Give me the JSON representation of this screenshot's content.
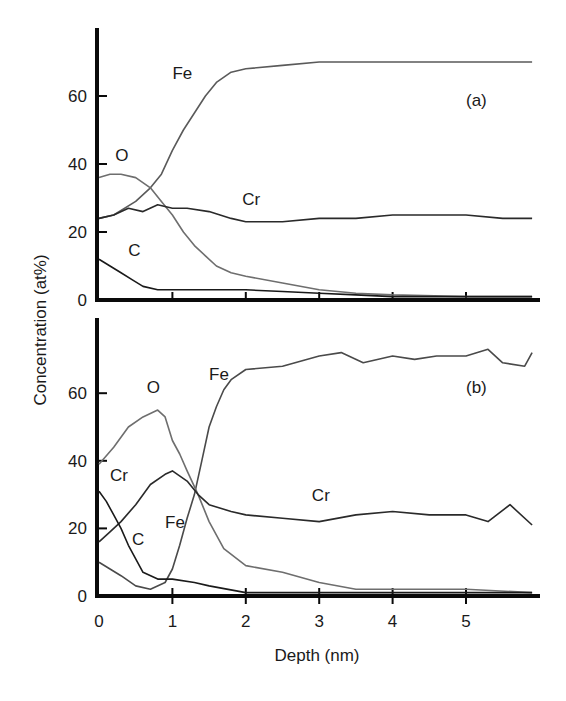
{
  "chart_data": [
    {
      "panel": "(a)",
      "type": "line",
      "title": "",
      "xlabel": "Depth (nm)",
      "ylabel": "Concentration (at%)",
      "xlim": [
        0,
        5.9
      ],
      "ylim": [
        0,
        75
      ],
      "x_ticks": [
        0,
        1,
        2,
        3,
        4,
        5
      ],
      "y_ticks": [
        0,
        20,
        40,
        60
      ],
      "grid": false,
      "legend": "inline labels",
      "series": [
        {
          "name": "Fe",
          "color": "#5a5a5a",
          "x": [
            0,
            0.2,
            0.5,
            0.7,
            0.85,
            1.0,
            1.15,
            1.3,
            1.45,
            1.6,
            1.8,
            2.0,
            2.5,
            3.0,
            3.5,
            4.0,
            4.5,
            5.0,
            5.5,
            5.9
          ],
          "y": [
            24,
            25,
            29,
            33,
            37,
            44,
            50,
            55,
            60,
            64,
            67,
            68,
            69,
            70,
            70,
            70,
            70,
            70,
            70,
            70
          ]
        },
        {
          "name": "O",
          "color": "#6e6e6e",
          "x": [
            0,
            0.15,
            0.3,
            0.5,
            0.7,
            0.85,
            1.0,
            1.15,
            1.3,
            1.45,
            1.6,
            1.8,
            2.0,
            2.5,
            3.0,
            3.5,
            4.0,
            5.0,
            5.9
          ],
          "y": [
            36,
            37,
            37,
            36,
            33,
            29,
            25,
            20,
            16,
            13,
            10,
            8,
            7,
            5,
            3,
            2,
            1.5,
            1,
            1
          ]
        },
        {
          "name": "Cr",
          "color": "#2a2a2a",
          "x": [
            0,
            0.2,
            0.4,
            0.6,
            0.8,
            1.0,
            1.2,
            1.5,
            1.8,
            2.0,
            2.5,
            3.0,
            3.5,
            4.0,
            4.5,
            5.0,
            5.5,
            5.9
          ],
          "y": [
            24,
            25,
            27,
            26,
            28,
            27,
            27,
            26,
            24,
            23,
            23,
            24,
            24,
            25,
            25,
            25,
            24,
            24
          ]
        },
        {
          "name": "C",
          "color": "#1a1a1a",
          "x": [
            0,
            0.15,
            0.3,
            0.45,
            0.6,
            0.8,
            1.0,
            1.5,
            2.0,
            2.5,
            3.0,
            3.5,
            4.0,
            5.0,
            5.9
          ],
          "y": [
            12,
            10,
            8,
            6,
            4,
            3,
            3,
            3,
            3,
            2.5,
            2,
            1.5,
            1,
            1,
            1
          ]
        }
      ],
      "annotations": [
        {
          "text": "Fe",
          "x": 1.0,
          "y": 65
        },
        {
          "text": "O",
          "x": 0.22,
          "y": 41
        },
        {
          "text": "Cr",
          "x": 1.95,
          "y": 28
        },
        {
          "text": "C",
          "x": 0.4,
          "y": 13
        },
        {
          "text": "(a)",
          "x": 5.0,
          "y": 57
        }
      ]
    },
    {
      "panel": "(b)",
      "type": "line",
      "title": "",
      "xlabel": "Depth (nm)",
      "ylabel": "Concentration (at%)",
      "xlim": [
        0,
        5.9
      ],
      "ylim": [
        0,
        75
      ],
      "x_ticks": [
        0,
        1,
        2,
        3,
        4,
        5
      ],
      "y_ticks": [
        0,
        20,
        40,
        60
      ],
      "grid": false,
      "legend": "inline labels",
      "series": [
        {
          "name": "Fe",
          "color": "#4a4a4a",
          "x": [
            0,
            0.15,
            0.3,
            0.5,
            0.7,
            0.9,
            1.0,
            1.1,
            1.2,
            1.3,
            1.4,
            1.5,
            1.6,
            1.7,
            1.8,
            2.0,
            2.5,
            3.0,
            3.3,
            3.6,
            4.0,
            4.3,
            4.6,
            5.0,
            5.3,
            5.5,
            5.8,
            5.9
          ],
          "y": [
            10,
            8,
            6,
            3,
            2,
            4,
            8,
            15,
            23,
            30,
            40,
            50,
            56,
            61,
            64,
            67,
            68,
            71,
            72,
            69,
            71,
            70,
            71,
            71,
            73,
            69,
            68,
            72
          ]
        },
        {
          "name": "O",
          "color": "#6e6e6e",
          "x": [
            0,
            0.2,
            0.4,
            0.6,
            0.8,
            0.9,
            1.0,
            1.1,
            1.2,
            1.35,
            1.5,
            1.7,
            2.0,
            2.5,
            3.0,
            3.5,
            4.0,
            5.0,
            5.9
          ],
          "y": [
            39,
            44,
            50,
            53,
            55,
            53,
            46,
            42,
            37,
            30,
            22,
            14,
            9,
            7,
            4,
            2,
            2,
            2,
            1
          ]
        },
        {
          "name": "Cr",
          "color": "#2a2a2a",
          "x": [
            0,
            0.15,
            0.3,
            0.5,
            0.7,
            0.9,
            1.0,
            1.2,
            1.35,
            1.5,
            1.8,
            2.0,
            2.5,
            3.0,
            3.5,
            4.0,
            4.5,
            5.0,
            5.3,
            5.6,
            5.9
          ],
          "y": [
            16,
            19,
            22,
            27,
            33,
            36,
            37,
            34,
            30,
            27,
            25,
            24,
            23,
            22,
            24,
            25,
            24,
            24,
            22,
            27,
            21
          ]
        },
        {
          "name": "C",
          "color": "#1a1a1a",
          "x": [
            0,
            0.1,
            0.2,
            0.3,
            0.4,
            0.5,
            0.6,
            0.8,
            1.0,
            1.3,
            1.5,
            2.0,
            3.0,
            4.0,
            5.0,
            5.9
          ],
          "y": [
            31,
            28,
            24,
            20,
            15,
            11,
            7,
            5,
            5,
            4,
            3,
            1,
            1,
            1,
            1,
            1
          ]
        }
      ],
      "annotations": [
        {
          "text": "Fe",
          "x": 1.5,
          "y": 64
        },
        {
          "text": "O",
          "x": 0.65,
          "y": 60
        },
        {
          "text": "Cr",
          "x": 0.15,
          "y": 34
        },
        {
          "text": "Fe",
          "x": 0.9,
          "y": 20
        },
        {
          "text": "C",
          "x": 0.45,
          "y": 15
        },
        {
          "text": "Cr",
          "x": 2.9,
          "y": 28
        },
        {
          "text": "(b)",
          "x": 5.0,
          "y": 60
        }
      ]
    }
  ],
  "axes": {
    "xlabel": "Depth (nm)",
    "ylabel": "Concentration (at%)",
    "x_tick_labels": [
      "0",
      "1",
      "2",
      "3",
      "4",
      "5"
    ],
    "y_tick_labels": [
      "0",
      "20",
      "40",
      "60"
    ]
  }
}
